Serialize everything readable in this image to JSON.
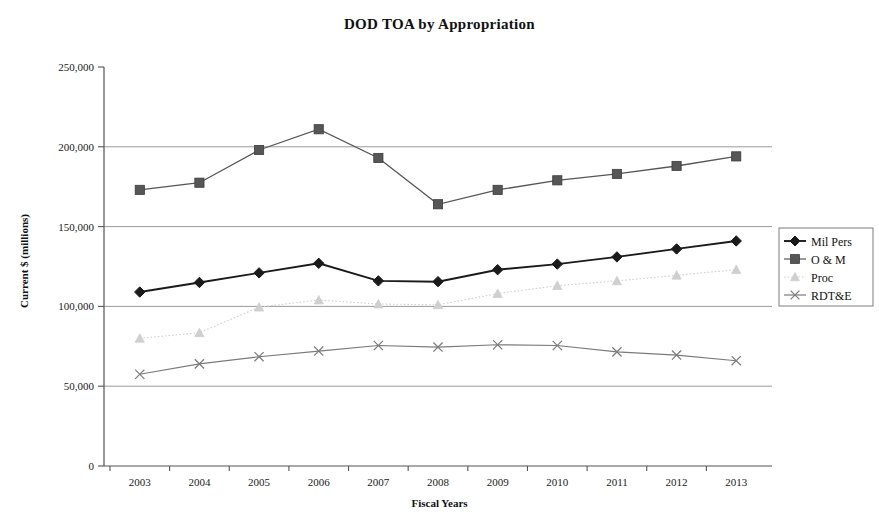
{
  "chart_data": {
    "type": "line",
    "title": "DOD TOA by Appropriation",
    "xlabel": "Fiscal Years",
    "ylabel": "Current $ (millions)",
    "categories": [
      "2003",
      "2004",
      "2005",
      "2006",
      "2007",
      "2008",
      "2009",
      "2010",
      "2011",
      "2012",
      "2013"
    ],
    "ylim": [
      0,
      250000
    ],
    "yticks": [
      0,
      50000,
      100000,
      150000,
      200000,
      250000
    ],
    "ytick_labels": [
      "0",
      "50,000",
      "100,000",
      "150,000",
      "200,000",
      "250,000"
    ],
    "grid": "horizontal",
    "legend_position": "right",
    "series": [
      {
        "name": "Mil Pers",
        "marker": "diamond",
        "line_style": "solid",
        "color": "#1a1a1a",
        "values": [
          109000,
          115000,
          121000,
          127000,
          116000,
          115500,
          123000,
          126500,
          131000,
          136000,
          141000
        ]
      },
      {
        "name": "O & M",
        "marker": "square",
        "line_style": "solid",
        "color": "#565656",
        "values": [
          173000,
          177500,
          198000,
          211000,
          193000,
          164000,
          173000,
          179000,
          183000,
          188000,
          194000
        ]
      },
      {
        "name": "Proc",
        "marker": "triangle",
        "line_style": "dotted",
        "color": "#cfcfcf",
        "values": [
          80000,
          83500,
          99500,
          104000,
          101500,
          101000,
          108000,
          113000,
          116000,
          119500,
          123000
        ]
      },
      {
        "name": "RDT&E",
        "marker": "x",
        "line_style": "dashed",
        "color": "#7a7a7a",
        "values": [
          57500,
          64000,
          68500,
          72000,
          75500,
          74500,
          76000,
          75500,
          71500,
          69500,
          66000
        ]
      }
    ]
  }
}
